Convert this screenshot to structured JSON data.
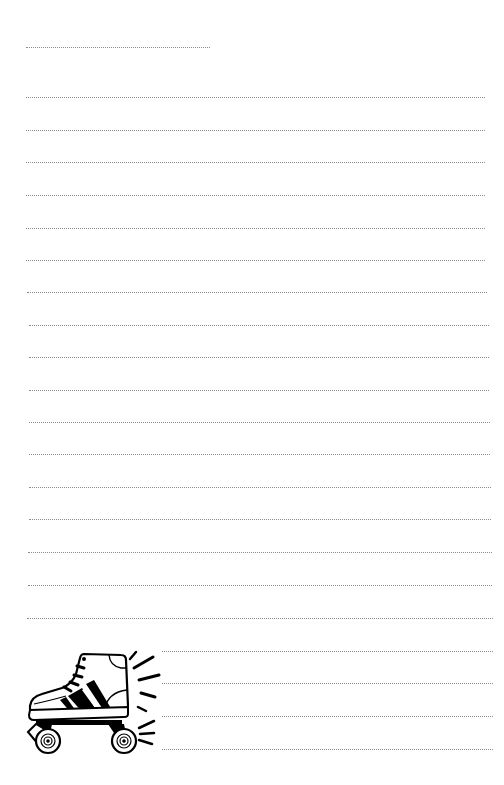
{
  "page": {
    "type": "lined writing paper",
    "background": "#ffffff",
    "rule_color": "#8a8a8a",
    "rule_style": "dotted"
  },
  "title_line": {
    "y": 47,
    "x_start": 26,
    "x_end": 210,
    "text": ""
  },
  "lines": [
    {
      "y": 97,
      "x_start": 26,
      "x_end": 485,
      "text": ""
    },
    {
      "y": 130,
      "x_start": 26,
      "x_end": 485,
      "text": ""
    },
    {
      "y": 162,
      "x_start": 26,
      "x_end": 485,
      "text": ""
    },
    {
      "y": 195,
      "x_start": 26,
      "x_end": 485,
      "text": ""
    },
    {
      "y": 228,
      "x_start": 26,
      "x_end": 485,
      "text": ""
    },
    {
      "y": 260,
      "x_start": 26,
      "x_end": 485,
      "text": ""
    },
    {
      "y": 292,
      "x_start": 27,
      "x_end": 487,
      "text": ""
    },
    {
      "y": 325,
      "x_start": 29,
      "x_end": 489,
      "text": ""
    },
    {
      "y": 357,
      "x_start": 29,
      "x_end": 489,
      "text": ""
    },
    {
      "y": 390,
      "x_start": 29,
      "x_end": 489,
      "text": ""
    },
    {
      "y": 422,
      "x_start": 29,
      "x_end": 490,
      "text": ""
    },
    {
      "y": 454,
      "x_start": 29,
      "x_end": 490,
      "text": ""
    },
    {
      "y": 487,
      "x_start": 29,
      "x_end": 491,
      "text": ""
    },
    {
      "y": 519,
      "x_start": 29,
      "x_end": 491,
      "text": ""
    },
    {
      "y": 552,
      "x_start": 28,
      "x_end": 492,
      "text": ""
    },
    {
      "y": 585,
      "x_start": 28,
      "x_end": 492,
      "text": ""
    },
    {
      "y": 618,
      "x_start": 27,
      "x_end": 493,
      "text": ""
    },
    {
      "y": 651,
      "x_start": 27,
      "x_end": 493,
      "text": ""
    },
    {
      "y": 683,
      "x_start": 27,
      "x_end": 493,
      "text": ""
    },
    {
      "y": 716,
      "x_start": 27,
      "x_end": 493,
      "text": ""
    },
    {
      "y": 749,
      "x_start": 27,
      "x_end": 493,
      "text": ""
    }
  ],
  "illustration": {
    "icon": "roller-skate-icon",
    "description": "black and white line drawing of a roller skate with motion lines",
    "position": "bottom-left"
  }
}
